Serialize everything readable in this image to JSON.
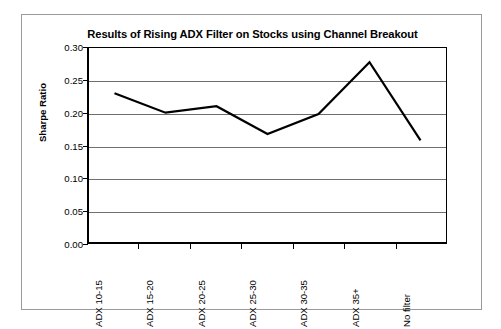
{
  "chart_data": {
    "type": "line",
    "title": "Results of Rising ADX Filter on Stocks using Channel Breakout",
    "xlabel": "",
    "ylabel": "Sharpe Ratio",
    "categories": [
      "ADX 10-15",
      "ADX 15-20",
      "ADX 20-25",
      "ADX 25-30",
      "ADX 30-35",
      "ADX 35+",
      "No filter"
    ],
    "values": [
      0.23,
      0.2,
      0.21,
      0.167,
      0.198,
      0.278,
      0.157
    ],
    "series": [
      {
        "name": "Sharpe Ratio",
        "values": [
          0.23,
          0.2,
          0.21,
          0.167,
          0.198,
          0.278,
          0.157
        ]
      }
    ],
    "ylim": [
      0.0,
      0.3
    ],
    "ytick_labels": [
      "0.00",
      "0.05",
      "0.10",
      "0.15",
      "0.20",
      "0.25",
      "0.30"
    ],
    "ytick_values": [
      0.0,
      0.05,
      0.1,
      0.15,
      0.2,
      0.25,
      0.3
    ],
    "grid": "horizontal",
    "legend": "none",
    "line_color": "#000000",
    "grid_color": "#6e6e6e",
    "axis_color": "#000000",
    "plot_background": "#ffffff",
    "markers": "none"
  }
}
